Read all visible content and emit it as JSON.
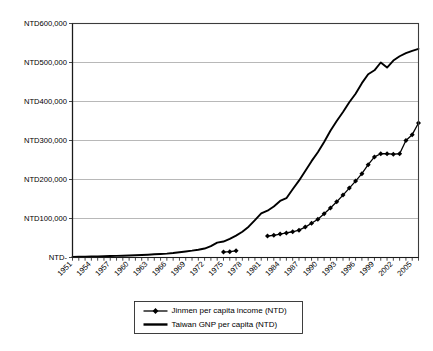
{
  "chart_data": {
    "type": "line",
    "title": "",
    "xlabel": "",
    "ylabel": "",
    "ylim": [
      0,
      600000
    ],
    "xlim": [
      1951,
      2006
    ],
    "grid": true,
    "legend_position": "bottom-center",
    "y_tick_labels": [
      "NTD600,000",
      "NTD500,000",
      "NTD400,000",
      "NTD300,000",
      "NTD200,000",
      "NTD100,000",
      "NTD-"
    ],
    "y_tick_values": [
      600000,
      500000,
      400000,
      300000,
      200000,
      100000,
      0
    ],
    "x_tick_labels": [
      "1951",
      "1954",
      "1957",
      "1960",
      "1963",
      "1966",
      "1969",
      "1972",
      "1975",
      "1978",
      "1981",
      "1984",
      "1987",
      "1990",
      "1993",
      "1996",
      "1999",
      "2002",
      "2005"
    ],
    "x_tick_values": [
      1951,
      1954,
      1957,
      1960,
      1963,
      1966,
      1969,
      1972,
      1975,
      1978,
      1981,
      1984,
      1987,
      1990,
      1993,
      1996,
      1999,
      2002,
      2005
    ],
    "x_minor_tick_values": [
      1951,
      1952,
      1953,
      1954,
      1955,
      1956,
      1957,
      1958,
      1959,
      1960,
      1961,
      1962,
      1963,
      1964,
      1965,
      1966,
      1967,
      1968,
      1969,
      1970,
      1971,
      1972,
      1973,
      1974,
      1975,
      1976,
      1977,
      1978,
      1979,
      1980,
      1981,
      1982,
      1983,
      1984,
      1985,
      1986,
      1987,
      1988,
      1989,
      1990,
      1991,
      1992,
      1993,
      1994,
      1995,
      1996,
      1997,
      1998,
      1999,
      2000,
      2001,
      2002,
      2003,
      2004,
      2005,
      2006
    ],
    "series": [
      {
        "name": "Jinmen per capita income (NTD)",
        "color": "#000000",
        "marker": "diamond",
        "line_width": 1.3,
        "x": [
          1975,
          1976,
          1977,
          1982,
          1983,
          1984,
          1985,
          1986,
          1987,
          1988,
          1989,
          1990,
          1991,
          1992,
          1993,
          1994,
          1995,
          1996,
          1997,
          1998,
          1999,
          2000,
          2001,
          2002,
          2003,
          2004,
          2005,
          2006
        ],
        "values": [
          14000,
          15000,
          17000,
          55000,
          57000,
          60000,
          63000,
          66000,
          70000,
          78000,
          88000,
          98000,
          112000,
          127000,
          143000,
          160000,
          178000,
          196000,
          215000,
          238000,
          258000,
          266000,
          266000,
          265000,
          266000,
          300000,
          315000,
          345000
        ]
      },
      {
        "name": "Taiwan GNP per capita (NTD)",
        "color": "#000000",
        "marker": "none",
        "line_width": 1.9,
        "x": [
          1951,
          1952,
          1953,
          1954,
          1955,
          1956,
          1957,
          1958,
          1959,
          1960,
          1961,
          1962,
          1963,
          1964,
          1965,
          1966,
          1967,
          1968,
          1969,
          1970,
          1971,
          1972,
          1973,
          1974,
          1975,
          1976,
          1977,
          1978,
          1979,
          1980,
          1981,
          1982,
          1983,
          1984,
          1985,
          1986,
          1987,
          1988,
          1989,
          1990,
          1991,
          1992,
          1993,
          1994,
          1995,
          1996,
          1997,
          1998,
          1999,
          2000,
          2001,
          2002,
          2003,
          2004,
          2005,
          2006
        ],
        "values": [
          1500,
          1800,
          2200,
          2500,
          2900,
          3300,
          3800,
          4100,
          4600,
          5300,
          5900,
          6400,
          7200,
          8200,
          9000,
          10000,
          11500,
          13500,
          15500,
          17500,
          20000,
          23000,
          29000,
          38000,
          41000,
          48000,
          56000,
          66000,
          79000,
          96000,
          113000,
          120000,
          131000,
          145000,
          152000,
          175000,
          197000,
          222000,
          247000,
          270000,
          296000,
          325000,
          350000,
          373000,
          398000,
          420000,
          447000,
          470000,
          480000,
          500000,
          487000,
          505000,
          516000,
          524000,
          530000,
          535000
        ]
      }
    ]
  },
  "legend": {
    "items": [
      {
        "label": "Jinmen per capita income (NTD)"
      },
      {
        "label": "Taiwan GNP per capita (NTD)"
      }
    ]
  }
}
